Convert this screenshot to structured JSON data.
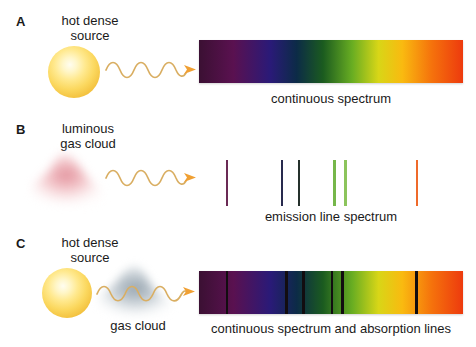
{
  "figure": {
    "background": "#ffffff",
    "width": 476,
    "height": 347
  },
  "panels": [
    {
      "letter": "A",
      "source_label": "hot dense\nsource",
      "caption": "continuous spectrum",
      "source_icon": "glowing-star-sphere",
      "wave_icon": "wavy-light-ray-arrow",
      "spectrum_type": "continuous"
    },
    {
      "letter": "B",
      "source_label": "luminous\ngas cloud",
      "caption": "emission line spectrum",
      "source_icon": "pink-gas-cloud",
      "wave_icon": "wavy-light-ray-arrow",
      "spectrum_type": "emission"
    },
    {
      "letter": "C",
      "source_label": "hot dense\nsource",
      "cloud_label": "gas cloud",
      "caption": "continuous spectrum and absorption lines",
      "source_icon": "glowing-star-sphere",
      "cloud_icon": "gray-gas-cloud",
      "wave_icon": "wavy-light-ray-arrow",
      "spectrum_type": "absorption"
    }
  ],
  "chart_data": {
    "type": "spectrum-diagram",
    "xlabel": "wavelength (short → long)",
    "ylabel": "",
    "continuous_spectrum": {
      "label": "continuous spectrum",
      "x_start_px": 199,
      "x_end_px": 463,
      "color_stops": [
        {
          "pos": 0.0,
          "hex": "#3b1033"
        },
        {
          "pos": 0.13,
          "hex": "#5a1150"
        },
        {
          "pos": 0.27,
          "hex": "#2a1a78"
        },
        {
          "pos": 0.37,
          "hex": "#0c2b47"
        },
        {
          "pos": 0.47,
          "hex": "#1b5b1f"
        },
        {
          "pos": 0.58,
          "hex": "#68ad22"
        },
        {
          "pos": 0.68,
          "hex": "#d8d617"
        },
        {
          "pos": 0.77,
          "hex": "#f9ba10"
        },
        {
          "pos": 0.88,
          "hex": "#f5730c"
        },
        {
          "pos": 1.0,
          "hex": "#ed3a0e"
        }
      ]
    },
    "emission_lines": [
      {
        "index": 1,
        "x_px": 226,
        "frac": 0.102,
        "hex": "#6b2a55",
        "width_px": 2,
        "name": "violet-line"
      },
      {
        "index": 2,
        "x_px": 281,
        "frac": 0.311,
        "hex": "#282a4e",
        "width_px": 2,
        "name": "indigo-line"
      },
      {
        "index": 3,
        "x_px": 298,
        "frac": 0.375,
        "hex": "#25312c",
        "width_px": 2,
        "name": "blue-green-line"
      },
      {
        "index": 4,
        "x_px": 333,
        "frac": 0.508,
        "hex": "#76b74a",
        "width_px": 3,
        "name": "green-line-1"
      },
      {
        "index": 5,
        "x_px": 344,
        "frac": 0.549,
        "hex": "#8cc45c",
        "width_px": 3,
        "name": "green-line-2"
      },
      {
        "index": 6,
        "x_px": 416,
        "frac": 0.822,
        "hex": "#ef6a2a",
        "width_px": 2,
        "name": "orange-line"
      }
    ],
    "absorption_lines": [
      {
        "index": 1,
        "x_px": 226,
        "frac": 0.102,
        "hex": "#120d10",
        "width_px": 2,
        "name": "violet-absorption"
      },
      {
        "index": 2,
        "x_px": 285,
        "frac": 0.326,
        "hex": "#120d10",
        "width_px": 3,
        "name": "indigo-absorption"
      },
      {
        "index": 3,
        "x_px": 302,
        "frac": 0.39,
        "hex": "#120d10",
        "width_px": 3,
        "name": "blue-green-absorption"
      },
      {
        "index": 4,
        "x_px": 331,
        "frac": 0.5,
        "hex": "#120d10",
        "width_px": 2,
        "name": "green-absorption-1"
      },
      {
        "index": 5,
        "x_px": 341,
        "frac": 0.538,
        "hex": "#120d10",
        "width_px": 3,
        "name": "green-absorption-2"
      },
      {
        "index": 6,
        "x_px": 415,
        "frac": 0.818,
        "hex": "#120d10",
        "width_px": 3,
        "name": "orange-absorption"
      }
    ],
    "legend": [
      "continuous spectrum",
      "emission line spectrum",
      "continuous spectrum and absorption lines"
    ]
  },
  "colors": {
    "source_core": "#fffdf0",
    "source_edge": "#dd9b22",
    "wave": "#d9ae62",
    "arrow": "#f0a033",
    "pink_cloud": "#e8a0a8",
    "gray_cloud": "#9aa7b0",
    "text": "#1a1a1a"
  }
}
